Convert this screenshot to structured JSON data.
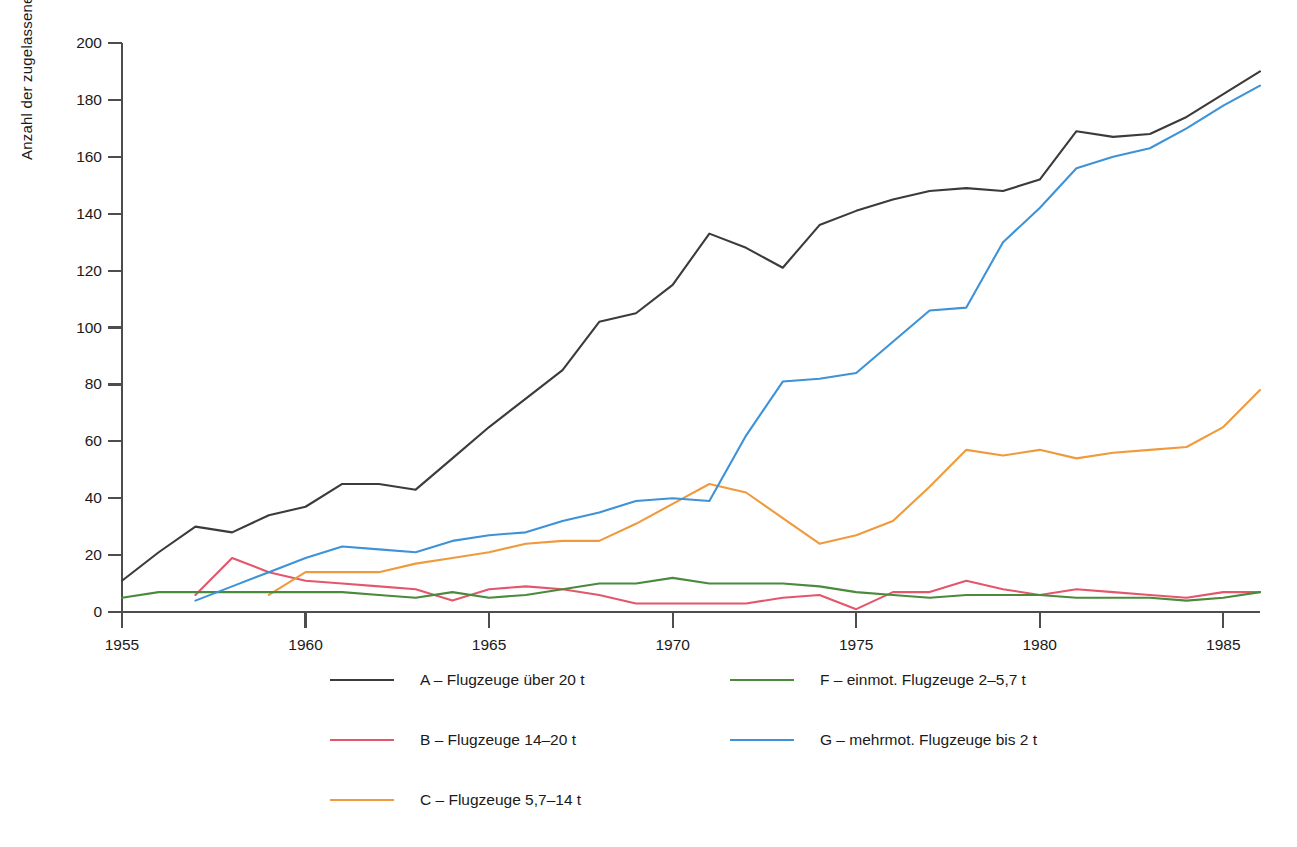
{
  "chart_data": {
    "type": "line",
    "title": "",
    "xlabel": "",
    "ylabel": "Anzahl der zugelassenen Luftfahrzeuge",
    "xlim": [
      1955,
      1986
    ],
    "ylim": [
      0,
      200
    ],
    "grid": false,
    "legend_position": "bottom",
    "x_ticks": [
      "1955",
      "1960",
      "1965",
      "1970",
      "1975",
      "1980",
      "1985"
    ],
    "x_tick_values": [
      1955,
      1960,
      1965,
      1970,
      1975,
      1980,
      1985
    ],
    "y_ticks": [
      "0",
      "20",
      "40",
      "60",
      "80",
      "100",
      "120",
      "140",
      "160",
      "180",
      "200"
    ],
    "y_tick_values": [
      0,
      20,
      40,
      60,
      80,
      100,
      120,
      140,
      160,
      180,
      200
    ],
    "series": [
      {
        "name": "A – Flugzeuge über 20 t",
        "key": "A",
        "color": "#3b3b3b",
        "x": [
          1955,
          1956,
          1957,
          1958,
          1959,
          1960,
          1961,
          1962,
          1963,
          1964,
          1965,
          1966,
          1967,
          1968,
          1969,
          1970,
          1971,
          1972,
          1973,
          1974,
          1975,
          1976,
          1977,
          1978,
          1979,
          1980,
          1981,
          1982,
          1983,
          1984,
          1985,
          1986
        ],
        "values": [
          11,
          21,
          30,
          28,
          34,
          37,
          45,
          45,
          43,
          54,
          65,
          75,
          85,
          102,
          105,
          115,
          133,
          128,
          121,
          136,
          141,
          145,
          148,
          149,
          148,
          152,
          169,
          167,
          168,
          174,
          182,
          190
        ]
      },
      {
        "name": "B – Flugzeuge 14–20 t",
        "key": "B",
        "color": "#e4566b",
        "x": [
          1957,
          1958,
          1959,
          1960,
          1961,
          1962,
          1963,
          1964,
          1965,
          1966,
          1967,
          1968,
          1969,
          1970,
          1971,
          1972,
          1973,
          1974,
          1975,
          1976,
          1977,
          1978,
          1979,
          1980,
          1981,
          1982,
          1983,
          1984,
          1985,
          1986
        ],
        "values": [
          6,
          19,
          14,
          11,
          10,
          9,
          8,
          4,
          8,
          9,
          8,
          6,
          3,
          3,
          3,
          3,
          5,
          6,
          1,
          7,
          7,
          11,
          8,
          6,
          8,
          7,
          6,
          5,
          7,
          7
        ]
      },
      {
        "name": "C – Flugzeuge 5,7–14 t",
        "key": "C",
        "color": "#ef9a3c",
        "x": [
          1959,
          1960,
          1961,
          1962,
          1963,
          1964,
          1965,
          1966,
          1967,
          1968,
          1969,
          1970,
          1971,
          1972,
          1973,
          1974,
          1975,
          1976,
          1977,
          1978,
          1979,
          1980,
          1981,
          1982,
          1983,
          1984,
          1985,
          1986
        ],
        "values": [
          6,
          14,
          14,
          14,
          17,
          19,
          21,
          24,
          25,
          25,
          31,
          38,
          45,
          42,
          33,
          24,
          27,
          32,
          44,
          57,
          55,
          57,
          54,
          56,
          57,
          58,
          65,
          78
        ]
      },
      {
        "name": "F – einmot. Flugzeuge 2–5,7 t",
        "key": "F",
        "color": "#4a8a3c",
        "x": [
          1955,
          1956,
          1957,
          1958,
          1959,
          1960,
          1961,
          1962,
          1963,
          1964,
          1965,
          1966,
          1967,
          1968,
          1969,
          1970,
          1971,
          1972,
          1973,
          1974,
          1975,
          1976,
          1977,
          1978,
          1979,
          1980,
          1981,
          1982,
          1983,
          1984,
          1985,
          1986
        ],
        "values": [
          5,
          7,
          7,
          7,
          7,
          7,
          7,
          6,
          5,
          7,
          5,
          6,
          8,
          10,
          10,
          12,
          10,
          10,
          10,
          9,
          7,
          6,
          5,
          6,
          6,
          6,
          5,
          5,
          5,
          4,
          5,
          7
        ]
      },
      {
        "name": "G – mehrmot. Flugzeuge bis 2 t",
        "key": "G",
        "color": "#3d92d8",
        "x": [
          1957,
          1958,
          1959,
          1960,
          1961,
          1962,
          1963,
          1964,
          1965,
          1966,
          1967,
          1968,
          1969,
          1970,
          1971,
          1972,
          1973,
          1974,
          1975,
          1976,
          1977,
          1978,
          1979,
          1980,
          1981,
          1982,
          1983,
          1984,
          1985,
          1986
        ],
        "values": [
          4,
          9,
          14,
          19,
          23,
          22,
          21,
          25,
          27,
          28,
          32,
          35,
          39,
          40,
          39,
          62,
          81,
          82,
          84,
          95,
          106,
          107,
          130,
          142,
          156,
          160,
          163,
          170,
          178,
          185
        ]
      }
    ]
  },
  "legend": {
    "items": [
      {
        "label": "A – Flugzeuge über 20 t",
        "color": "#3b3b3b",
        "column": 0,
        "row": 0
      },
      {
        "label": "B – Flugzeuge 14–20 t",
        "color": "#e4566b",
        "column": 0,
        "row": 1
      },
      {
        "label": "C – Flugzeuge 5,7–14 t",
        "color": "#ef9a3c",
        "column": 0,
        "row": 2
      },
      {
        "label": "F – einmot. Flugzeuge 2–5,7 t",
        "color": "#4a8a3c",
        "column": 1,
        "row": 0
      },
      {
        "label": "G – mehrmot. Flugzeuge bis 2 t",
        "color": "#3d92d8",
        "column": 1,
        "row": 1
      }
    ]
  },
  "axes": {
    "y_axis_title": "Anzahl der zugelassenen Luftfahrzeuge",
    "axis_color": "#4d4d4d"
  }
}
